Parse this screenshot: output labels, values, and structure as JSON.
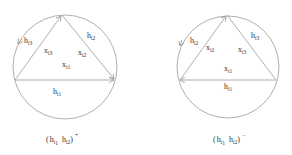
{
  "figures": [
    {
      "caption": {
        "base1": "h",
        "sub1": "i",
        "subsub1": "1",
        "base2": "h",
        "sub2": "i",
        "subsub2": "2",
        "sign": "+"
      },
      "edges": {
        "bottom_h": {
          "base": "h",
          "sub": "i1"
        },
        "left_h": {
          "base": "h",
          "sub": "i3"
        },
        "right_h": {
          "base": "h",
          "sub": "i2"
        },
        "left_x": {
          "base": "x",
          "sub": "i3"
        },
        "right_x": {
          "base": "x",
          "sub": "i2"
        },
        "center_x": {
          "base": "x",
          "sub": "i1"
        }
      }
    },
    {
      "caption": {
        "base1": "h",
        "sub1": "i",
        "subsub1": "1",
        "base2": "h",
        "sub2": "i",
        "subsub2": "2",
        "sign": "−"
      },
      "edges": {
        "bottom_h": {
          "base": "h",
          "sub": "i1"
        },
        "left_h": {
          "base": "h",
          "sub": "i2"
        },
        "right_h": {
          "base": "h",
          "sub": "i3"
        },
        "left_x": {
          "base": "x",
          "sub": "i2"
        },
        "right_x": {
          "base": "x",
          "sub": "i3"
        },
        "center_x": {
          "base": "x",
          "sub": "i1"
        }
      }
    }
  ],
  "colors": {
    "line": "#9a9a9a",
    "text": "#333333"
  }
}
